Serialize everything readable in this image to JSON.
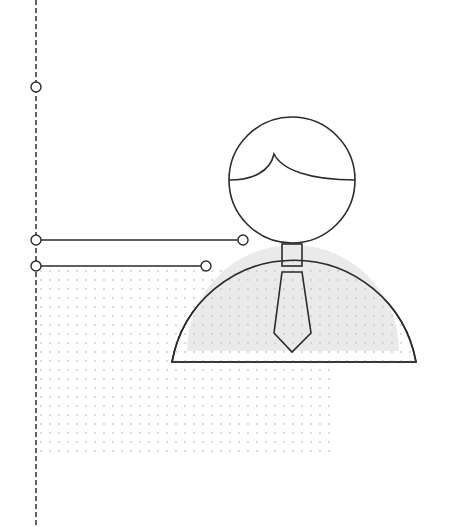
{
  "illustration": {
    "subject": "person-with-tie",
    "colors": {
      "stroke": "#2b2b2b",
      "dashed_line": "#3a3a3a",
      "body_fill": "#e9e9e9",
      "dot": "#c9c9c9",
      "background": "#ffffff"
    },
    "timeline": {
      "nodes": [
        {
          "label": "",
          "y": 87
        },
        {
          "label": "",
          "y": 240
        },
        {
          "label": "",
          "y": 266
        }
      ]
    },
    "connectors": [
      {
        "from": "node-2",
        "to": "shoulder-point-upper"
      },
      {
        "from": "node-3",
        "to": "shoulder-point-lower"
      }
    ]
  }
}
